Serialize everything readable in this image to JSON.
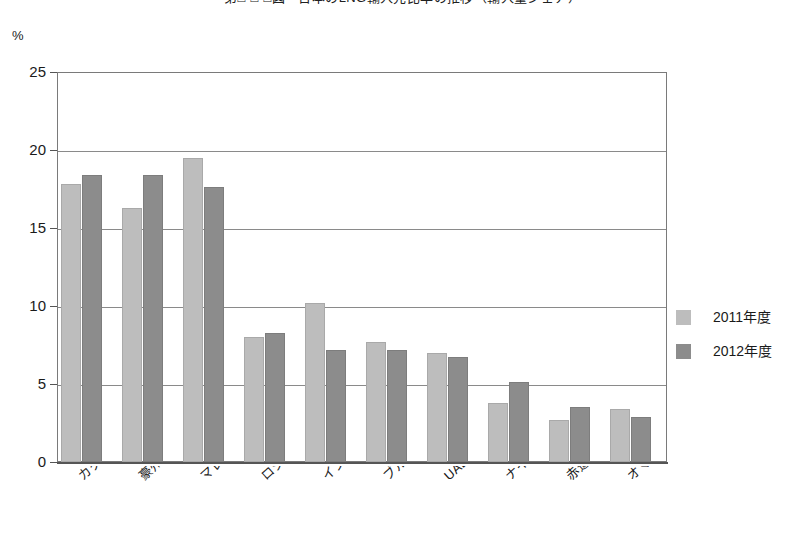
{
  "chart_data": {
    "type": "bar",
    "title": "第□-□-□図　日本のLNG輸入先比率の推移（輸入量シェア）",
    "ylabel": "%",
    "xlabel": "",
    "ylim": [
      0,
      25
    ],
    "yticks": [
      0,
      5,
      10,
      15,
      20,
      25
    ],
    "grid": true,
    "legend_position": "right",
    "categories": [
      "カタール",
      "豪州",
      "マレーシア",
      "ロシア",
      "インドネシア",
      "ブルネイ",
      "UAE",
      "ナイジェリア",
      "赤道ギニア",
      "オマーン"
    ],
    "series": [
      {
        "name": "2011年度",
        "color": "#bdbdbd",
        "values": [
          17.8,
          16.3,
          19.5,
          8.0,
          10.2,
          7.7,
          7.0,
          3.8,
          2.7,
          3.4
        ]
      },
      {
        "name": "2012年度",
        "color": "#8c8c8c",
        "values": [
          18.4,
          18.4,
          17.6,
          8.3,
          7.2,
          7.2,
          6.7,
          5.1,
          3.5,
          2.9
        ]
      }
    ]
  },
  "axis": {
    "unit_label": "%",
    "tick_labels": [
      "25",
      "20",
      "15",
      "10",
      "5",
      "0"
    ]
  },
  "legend": {
    "items": [
      {
        "label": "2011年度",
        "swatch": "light-gray-swatch"
      },
      {
        "label": "2012年度",
        "swatch": "dark-gray-swatch"
      }
    ]
  }
}
